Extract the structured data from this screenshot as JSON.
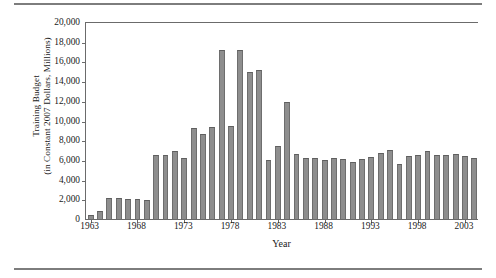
{
  "chart_data": {
    "type": "bar",
    "title": "",
    "xlabel": "Year",
    "ylabel_line1": "Training Budget",
    "ylabel_line2": "(in Constant 2007 Dollars, Millions)",
    "ylim": [
      0,
      20000
    ],
    "yticks": [
      0,
      2000,
      4000,
      6000,
      8000,
      10000,
      12000,
      14000,
      16000,
      18000,
      20000
    ],
    "ytick_labels": [
      "0",
      "2,000",
      "4,000",
      "6,000",
      "8,000",
      "10,000",
      "12,000",
      "14,000",
      "16,000",
      "18,000",
      "20,000"
    ],
    "xtick_labels": [
      "1963",
      "1968",
      "1973",
      "1978",
      "1983",
      "1988",
      "1993",
      "1998",
      "2003"
    ],
    "xticks": [
      1963,
      1968,
      1973,
      1978,
      1983,
      1988,
      1993,
      1998,
      2003
    ],
    "grid": false,
    "legend": false,
    "bar_color": "#8e8e8e",
    "bar_edge_color": "#6e6e6e",
    "categories": [
      1963,
      1964,
      1965,
      1966,
      1967,
      1968,
      1969,
      1970,
      1971,
      1972,
      1973,
      1974,
      1975,
      1976,
      1977,
      1978,
      1979,
      1980,
      1981,
      1982,
      1983,
      1984,
      1985,
      1986,
      1987,
      1988,
      1989,
      1990,
      1991,
      1992,
      1993,
      1994,
      1995,
      1996,
      1997,
      1998,
      1999,
      2000,
      2001,
      2002,
      2003,
      2004
    ],
    "values": [
      400,
      850,
      2150,
      2130,
      2020,
      2020,
      1960,
      6450,
      6450,
      6950,
      6150,
      9250,
      8600,
      9350,
      17150,
      9400,
      17200,
      14950,
      15100,
      6000,
      7450,
      11900,
      6600,
      6200,
      6150,
      6000,
      6150,
      6100,
      5800,
      6050,
      6300,
      6750,
      7000,
      5600,
      6350,
      6500,
      6950,
      6450,
      6450,
      6550,
      6350,
      6200
    ]
  }
}
